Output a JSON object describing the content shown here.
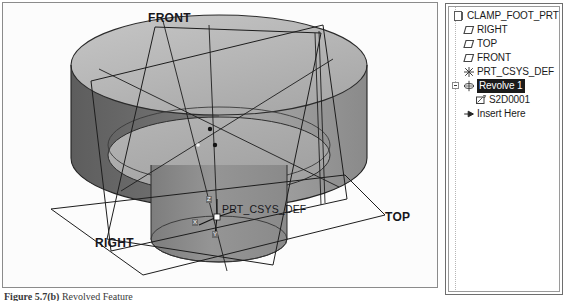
{
  "viewport": {
    "name": "graphics-window",
    "labels": {
      "front": "FRONT",
      "right": "RIGHT",
      "top": "TOP",
      "csys": "PRT_CSYS_DEF"
    },
    "csys_axes": {
      "x": "X",
      "y": "Y",
      "z": "Z"
    },
    "colors": {
      "background": "#fcfcfc",
      "part_light": "#b9b9b9",
      "part_mid": "#a3a3a3",
      "part_dark": "#6f6f6f",
      "edge": "#1f1f1f",
      "datum": "#303030"
    }
  },
  "model_tree": {
    "title": "model-tree",
    "items": [
      {
        "label": "CLAMP_FOOT_PRT",
        "icon": "part-icon",
        "depth": 0,
        "selected": false,
        "expander": false
      },
      {
        "label": "RIGHT",
        "icon": "datum-plane-icon",
        "depth": 1,
        "selected": false,
        "expander": false
      },
      {
        "label": "TOP",
        "icon": "datum-plane-icon",
        "depth": 1,
        "selected": false,
        "expander": false
      },
      {
        "label": "FRONT",
        "icon": "datum-plane-icon",
        "depth": 1,
        "selected": false,
        "expander": false
      },
      {
        "label": "PRT_CSYS_DEF",
        "icon": "coordinate-system-icon",
        "depth": 1,
        "selected": false,
        "expander": false
      },
      {
        "label": "Revolve 1",
        "icon": "revolve-feature-icon",
        "depth": 1,
        "selected": true,
        "expander": true
      },
      {
        "label": "S2D0001",
        "icon": "sketch-icon",
        "depth": 2,
        "selected": false,
        "expander": false
      },
      {
        "label": "Insert Here",
        "icon": "insert-here-icon",
        "depth": 1,
        "selected": false,
        "expander": false
      }
    ]
  },
  "caption": {
    "label": "Figure   5.7(b)",
    "text": " Revolved Feature"
  }
}
